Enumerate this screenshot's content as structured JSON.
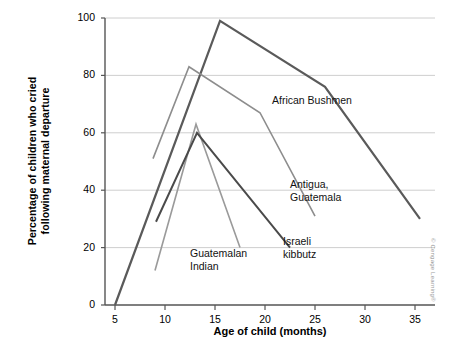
{
  "chart_data": {
    "type": "line",
    "title": "",
    "xlabel": "Age of child (months)",
    "ylabel": "Percentage of children who cried\nfollowing maternal departure",
    "xlim": [
      4,
      37
    ],
    "ylim": [
      0,
      100
    ],
    "xticks": [
      5,
      10,
      15,
      20,
      25,
      30,
      35
    ],
    "yticks": [
      0,
      20,
      40,
      60,
      80,
      100
    ],
    "grid": true,
    "legend_position": "inline-annotations",
    "series": [
      {
        "name": "African Bushmen",
        "color": "#5a5a5a",
        "width": 2.2,
        "points": [
          [
            5,
            0
          ],
          [
            15.5,
            99
          ],
          [
            26,
            76
          ],
          [
            35.5,
            30
          ]
        ]
      },
      {
        "name": "Antigua, Guatemala",
        "color": "#8d8d8d",
        "width": 1.6,
        "points": [
          [
            8.8,
            51
          ],
          [
            12.4,
            83
          ],
          [
            19.5,
            67
          ],
          [
            25,
            31
          ]
        ]
      },
      {
        "name": "Guatemalan Indian",
        "color": "#9a9a9a",
        "width": 1.6,
        "points": [
          [
            9,
            12
          ],
          [
            13.1,
            63
          ],
          [
            17.5,
            20
          ]
        ]
      },
      {
        "name": "Israeli kibbutz",
        "color": "#4a4a4a",
        "width": 2.0,
        "points": [
          [
            9.1,
            29
          ],
          [
            13.2,
            60
          ],
          [
            22.5,
            20
          ]
        ]
      }
    ],
    "annotations": [
      {
        "name": "african-bushmen",
        "text": "African Bushmen",
        "x": 272,
        "y": 94
      },
      {
        "name": "antigua-guatemala",
        "text": "Antigua,\nGuatemala",
        "x": 290,
        "y": 178
      },
      {
        "name": "guatemalan-indian",
        "text": "Guatemalan\nIndian",
        "x": 190,
        "y": 247
      },
      {
        "name": "israeli-kibbutz",
        "text": "Israeli\nkibbutz",
        "x": 283,
        "y": 235
      }
    ]
  },
  "credit": {
    "text": "© Cengage Learning®"
  }
}
